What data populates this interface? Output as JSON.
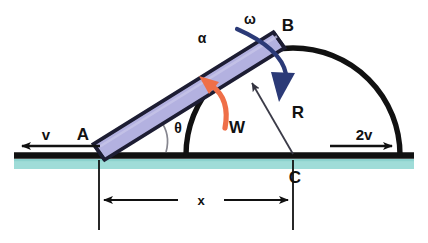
{
  "diagram": {
    "type": "free-body-kinematics-diagram",
    "colors": {
      "rod_fill": "#b3b1e0",
      "rod_stroke": "#1a1a2e",
      "ground": "#111111",
      "ground_band": "#9fdcd8",
      "alpha_arrow": "#ef6f48",
      "omega_arrow": "#2b3a77",
      "reaction_line": "#4a4a55",
      "angle_arc": "#7a7a85",
      "dimension": "#111111",
      "text": "#111111",
      "background": "#ffffff"
    },
    "labels": {
      "point_a": "A",
      "point_b": "B",
      "point_c": "C",
      "velocity_left": "v",
      "velocity_right": "2v",
      "angle": "θ",
      "angular_accel": "α",
      "angular_velocity": "ω",
      "weight": "W",
      "reaction": "R",
      "distance": "x"
    }
  },
  "geometry": {
    "ground_line_y": 155,
    "ground_band": {
      "top": 159,
      "bottom": 169,
      "left": 14,
      "right": 414
    },
    "rod": {
      "a_x": 99,
      "a_y": 152,
      "b_x": 279,
      "b_y": 40,
      "half_width": 9
    },
    "semicircle": {
      "cx": 293,
      "cy": 155,
      "r": 107
    },
    "dimension_x": {
      "left_x": 99,
      "right_x": 293,
      "y": 200,
      "ext_top": 160,
      "ext_bottom": 230
    },
    "velocity_left_arrow": {
      "x1": 100,
      "x2": 12,
      "y": 146
    },
    "velocity_right_arrow": {
      "x1": 330,
      "x2": 400,
      "y": 146
    }
  },
  "elements": [
    {
      "name": "rod-ab",
      "label": ""
    },
    {
      "name": "semicircle-surface",
      "label": ""
    },
    {
      "name": "ground-line",
      "label": ""
    },
    {
      "name": "velocity-v-arrow",
      "label": "v"
    },
    {
      "name": "velocity-2v-arrow",
      "label": "2v"
    },
    {
      "name": "alpha-arrow",
      "label": "α"
    },
    {
      "name": "omega-arrow",
      "label": "ω"
    },
    {
      "name": "weight-label",
      "label": "W"
    },
    {
      "name": "reaction-arrow",
      "label": "R"
    },
    {
      "name": "theta-arc",
      "label": "θ"
    },
    {
      "name": "dimension-x",
      "label": "x"
    }
  ]
}
